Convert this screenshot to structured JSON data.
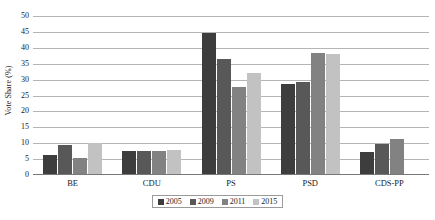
{
  "chart_data": {
    "type": "bar",
    "title": "",
    "xlabel": "",
    "ylabel": "Vote Share (%)",
    "ylim": [
      0,
      50
    ],
    "ytick_step": 5,
    "yticks": [
      50,
      45,
      40,
      35,
      30,
      25,
      20,
      15,
      10,
      5,
      0
    ],
    "grid": true,
    "legend_position": "bottom",
    "categories": [
      "BE",
      "CDU",
      "PS",
      "PSD",
      "CDS-PP"
    ],
    "series": [
      {
        "name": "2005",
        "color": "#3d3d3d",
        "values": [
          6.4,
          7.5,
          44.6,
          28.5,
          7.1
        ]
      },
      {
        "name": "2009",
        "color": "#585858",
        "values": [
          9.4,
          7.7,
          36.4,
          29.1,
          9.9
        ]
      },
      {
        "name": "2011",
        "color": "#828282",
        "values": [
          5.2,
          7.7,
          27.8,
          38.4,
          11.4
        ]
      },
      {
        "name": "2015",
        "color": "#c2c2c2",
        "values": [
          10.2,
          7.9,
          32.2,
          38.0,
          null
        ]
      }
    ]
  },
  "axis": {
    "y_title": "Vote Share (%)"
  },
  "colors": {
    "gridline": "#b5b5b5",
    "axis": "#777777",
    "text": "#1a1a1a",
    "legend_border": "#9a9a9a",
    "background": "#ffffff"
  }
}
